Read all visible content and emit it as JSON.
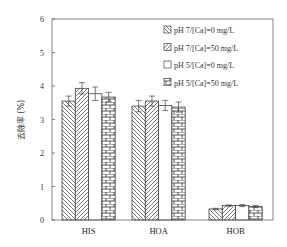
{
  "chart_data": {
    "type": "bar",
    "title": "",
    "xlabel": "",
    "ylabel": "去除率 (%)",
    "ylim": [
      0,
      6
    ],
    "yticks": [
      0,
      1,
      2,
      3,
      4,
      5,
      6
    ],
    "grid": false,
    "legend_position": "upper right",
    "categories": [
      "HIS",
      "HOA",
      "HOB"
    ],
    "series": [
      {
        "name": "pH 7/[Ca]=0 mg/L",
        "pattern": "diagonal-back",
        "values": [
          3.55,
          3.4,
          0.33
        ],
        "errors": [
          0.15,
          0.17,
          0.02
        ]
      },
      {
        "name": "pH 7/[Ca]=50 mg/L",
        "pattern": "diagonal-forward",
        "values": [
          3.93,
          3.55,
          0.43
        ],
        "errors": [
          0.17,
          0.15,
          0.02
        ]
      },
      {
        "name": "pH 5/[Ca]=0 mg/L",
        "pattern": "blank",
        "values": [
          3.77,
          3.42,
          0.43
        ],
        "errors": [
          0.2,
          0.15,
          0.03
        ]
      },
      {
        "name": "pH 5/[Ca]=50 mg/L",
        "pattern": "brick",
        "values": [
          3.67,
          3.37,
          0.4
        ],
        "errors": [
          0.14,
          0.15,
          0.03
        ]
      }
    ]
  },
  "axis": {
    "ylabel": "去除率 (%)",
    "yticks": [
      "0",
      "1",
      "2",
      "3",
      "4",
      "5",
      "6"
    ],
    "categories": [
      "HIS",
      "HOA",
      "HOB"
    ]
  },
  "legend": [
    "pH 7/[Ca]=0 mg/L",
    "pH 7/[Ca]=50 mg/L",
    "pH 5/[Ca]=0 mg/L",
    "pH 5/[Ca]=50 mg/L"
  ],
  "colors": {
    "axis": "#666666",
    "bar_stroke": "#444444",
    "background": "#ffffff"
  }
}
